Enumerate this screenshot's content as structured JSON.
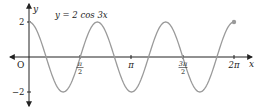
{
  "chart_data": {
    "type": "line",
    "title": "y = 2 cos 3x",
    "function": "2*cos(3*x)",
    "xlabel": "x",
    "ylabel": "y",
    "xlim": [
      0,
      6.2832
    ],
    "ylim": [
      -2,
      2
    ],
    "x_ticks": [
      {
        "value": 1.5708,
        "label": "π/2"
      },
      {
        "value": 3.1416,
        "label": "π"
      },
      {
        "value": 4.7124,
        "label": "3π/2"
      },
      {
        "value": 6.2832,
        "label": "2π"
      }
    ],
    "y_ticks": [
      {
        "value": 2,
        "label": "2"
      },
      {
        "value": -2,
        "label": "−2"
      }
    ],
    "origin_label": "O",
    "series": [
      {
        "name": "y = 2 cos 3x",
        "x": [
          0,
          0.5236,
          1.0472,
          1.5708,
          2.0944,
          2.618,
          3.1416,
          3.6652,
          4.1888,
          4.7124,
          5.236,
          5.7596,
          6.2832
        ],
        "values": [
          2,
          0,
          -2,
          0,
          2,
          0,
          -2,
          0,
          2,
          0,
          -2,
          0,
          2
        ]
      }
    ],
    "endpoint_marker": {
      "x": 6.2832,
      "y": 2
    },
    "grid": false,
    "colors": {
      "curve": "#9a9a9a",
      "axes": "#222222",
      "marker": "#9a9a9a"
    }
  },
  "labels": {
    "equation": "y = 2 cos 3x",
    "x_axis": "x",
    "y_axis": "y",
    "origin": "O",
    "y_tick_pos": "2",
    "y_tick_neg": "−2",
    "x_tick_pi": "π",
    "x_tick_2pi": "2π",
    "frac_pi": "π",
    "frac_3pi": "3π",
    "frac_den": "2"
  }
}
